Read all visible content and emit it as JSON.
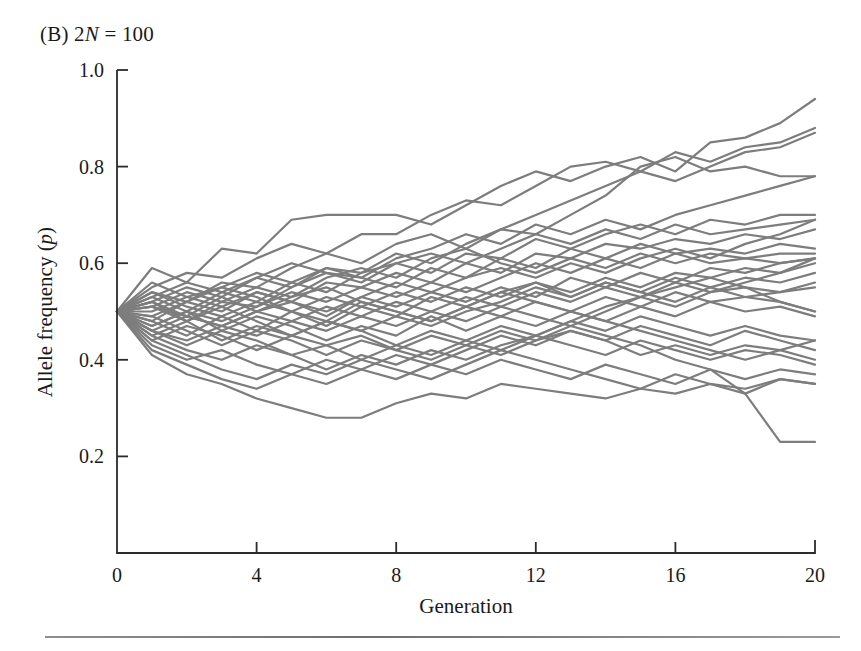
{
  "figure": {
    "panel_label": "(B)",
    "panel_title_text": "2N = 100",
    "panel_title_prefix": "2",
    "panel_title_italic": "N",
    "panel_title_suffix": " = 100",
    "background_color": "#ffffff",
    "line_color": "#7d7d7d",
    "axis_color": "#2b2b2b",
    "rule_color": "#8a8a8a"
  },
  "axes": {
    "x": {
      "title": "Generation",
      "ticks": [
        0,
        4,
        8,
        12,
        16,
        20
      ],
      "tick_labels": [
        "0",
        "4",
        "8",
        "12",
        "16",
        "20"
      ],
      "min": 0,
      "max": 20
    },
    "y": {
      "title_prefix": "Allele frequency (",
      "title_italic": "p",
      "title_suffix": ")",
      "title": "Allele frequency (p)",
      "ticks": [
        0.2,
        0.4,
        0.6,
        0.8,
        1.0
      ],
      "tick_labels": [
        "0.2",
        "0.4",
        "0.6",
        "0.8",
        "1.0"
      ],
      "min": 0.0,
      "max": 1.0
    }
  },
  "chart_data": {
    "type": "line",
    "title": "(B) 2N = 100",
    "xlabel": "Generation",
    "ylabel": "Allele frequency (p)",
    "xlim": [
      0,
      20
    ],
    "ylim": [
      0,
      1
    ],
    "grid": false,
    "legend": "none",
    "line_color": "#7d7d7d",
    "line_width": 2.2,
    "x": [
      0,
      1,
      2,
      3,
      4,
      5,
      6,
      7,
      8,
      9,
      10,
      11,
      12,
      13,
      14,
      15,
      16,
      17,
      18,
      19,
      20
    ],
    "series": [
      {
        "name": "replicate-1",
        "values": [
          0.5,
          0.59,
          0.56,
          0.63,
          0.62,
          0.69,
          0.7,
          0.7,
          0.7,
          0.68,
          0.72,
          0.76,
          0.79,
          0.77,
          0.8,
          0.82,
          0.79,
          0.85,
          0.86,
          0.89,
          0.94
        ]
      },
      {
        "name": "replicate-2",
        "values": [
          0.5,
          0.55,
          0.58,
          0.57,
          0.61,
          0.64,
          0.62,
          0.66,
          0.66,
          0.7,
          0.73,
          0.72,
          0.76,
          0.8,
          0.81,
          0.79,
          0.83,
          0.81,
          0.84,
          0.85,
          0.88
        ]
      },
      {
        "name": "replicate-3",
        "values": [
          0.5,
          0.54,
          0.52,
          0.56,
          0.55,
          0.59,
          0.62,
          0.6,
          0.64,
          0.66,
          0.63,
          0.67,
          0.7,
          0.73,
          0.76,
          0.79,
          0.77,
          0.8,
          0.83,
          0.84,
          0.87
        ]
      },
      {
        "name": "replicate-4",
        "values": [
          0.5,
          0.53,
          0.5,
          0.54,
          0.57,
          0.55,
          0.59,
          0.58,
          0.62,
          0.6,
          0.64,
          0.67,
          0.66,
          0.7,
          0.74,
          0.8,
          0.82,
          0.79,
          0.8,
          0.78,
          0.78
        ]
      },
      {
        "name": "replicate-5",
        "values": [
          0.5,
          0.52,
          0.55,
          0.53,
          0.57,
          0.6,
          0.58,
          0.57,
          0.61,
          0.63,
          0.66,
          0.64,
          0.68,
          0.66,
          0.69,
          0.67,
          0.7,
          0.72,
          0.74,
          0.76,
          0.78
        ]
      },
      {
        "name": "replicate-6",
        "values": [
          0.5,
          0.51,
          0.48,
          0.52,
          0.51,
          0.55,
          0.58,
          0.56,
          0.6,
          0.58,
          0.62,
          0.61,
          0.65,
          0.63,
          0.66,
          0.68,
          0.66,
          0.69,
          0.68,
          0.7,
          0.7
        ]
      },
      {
        "name": "replicate-7",
        "values": [
          0.5,
          0.56,
          0.53,
          0.55,
          0.58,
          0.56,
          0.54,
          0.58,
          0.6,
          0.62,
          0.6,
          0.63,
          0.66,
          0.64,
          0.67,
          0.65,
          0.68,
          0.66,
          0.67,
          0.68,
          0.69
        ]
      },
      {
        "name": "replicate-8",
        "values": [
          0.5,
          0.48,
          0.52,
          0.5,
          0.54,
          0.52,
          0.56,
          0.55,
          0.58,
          0.56,
          0.6,
          0.58,
          0.62,
          0.61,
          0.64,
          0.63,
          0.65,
          0.64,
          0.66,
          0.65,
          0.67
        ]
      },
      {
        "name": "replicate-9",
        "values": [
          0.5,
          0.53,
          0.56,
          0.54,
          0.52,
          0.56,
          0.59,
          0.57,
          0.55,
          0.59,
          0.57,
          0.61,
          0.59,
          0.63,
          0.61,
          0.64,
          0.62,
          0.63,
          0.62,
          0.64,
          0.63
        ]
      },
      {
        "name": "replicate-10",
        "values": [
          0.5,
          0.51,
          0.54,
          0.52,
          0.55,
          0.53,
          0.57,
          0.59,
          0.57,
          0.61,
          0.63,
          0.6,
          0.58,
          0.61,
          0.59,
          0.62,
          0.6,
          0.62,
          0.61,
          0.62,
          0.62
        ]
      },
      {
        "name": "replicate-11",
        "values": [
          0.5,
          0.47,
          0.5,
          0.48,
          0.51,
          0.54,
          0.52,
          0.55,
          0.53,
          0.56,
          0.54,
          0.57,
          0.6,
          0.58,
          0.61,
          0.59,
          0.62,
          0.6,
          0.61,
          0.6,
          0.61
        ]
      },
      {
        "name": "replicate-12",
        "values": [
          0.5,
          0.52,
          0.49,
          0.53,
          0.5,
          0.52,
          0.49,
          0.53,
          0.51,
          0.54,
          0.52,
          0.55,
          0.53,
          0.57,
          0.55,
          0.58,
          0.56,
          0.59,
          0.58,
          0.6,
          0.61
        ]
      },
      {
        "name": "replicate-13",
        "values": [
          0.5,
          0.49,
          0.52,
          0.55,
          0.53,
          0.5,
          0.53,
          0.51,
          0.54,
          0.52,
          0.55,
          0.53,
          0.56,
          0.54,
          0.57,
          0.55,
          0.58,
          0.57,
          0.59,
          0.58,
          0.6
        ]
      },
      {
        "name": "replicate-14",
        "values": [
          0.5,
          0.54,
          0.51,
          0.49,
          0.52,
          0.5,
          0.47,
          0.51,
          0.49,
          0.53,
          0.51,
          0.54,
          0.56,
          0.53,
          0.56,
          0.54,
          0.57,
          0.55,
          0.57,
          0.56,
          0.58
        ]
      },
      {
        "name": "replicate-15",
        "values": [
          0.5,
          0.46,
          0.49,
          0.47,
          0.5,
          0.48,
          0.51,
          0.49,
          0.52,
          0.5,
          0.53,
          0.51,
          0.54,
          0.52,
          0.55,
          0.53,
          0.56,
          0.54,
          0.55,
          0.54,
          0.56
        ]
      },
      {
        "name": "replicate-16",
        "values": [
          0.5,
          0.48,
          0.45,
          0.49,
          0.46,
          0.5,
          0.48,
          0.52,
          0.5,
          0.48,
          0.51,
          0.49,
          0.52,
          0.5,
          0.53,
          0.51,
          0.54,
          0.52,
          0.53,
          0.54,
          0.55
        ]
      },
      {
        "name": "replicate-17",
        "values": [
          0.5,
          0.52,
          0.48,
          0.51,
          0.48,
          0.45,
          0.48,
          0.46,
          0.49,
          0.47,
          0.5,
          0.52,
          0.55,
          0.53,
          0.56,
          0.54,
          0.52,
          0.55,
          0.53,
          0.52,
          0.5
        ]
      },
      {
        "name": "replicate-18",
        "values": [
          0.5,
          0.47,
          0.5,
          0.46,
          0.49,
          0.47,
          0.44,
          0.47,
          0.45,
          0.49,
          0.46,
          0.49,
          0.47,
          0.5,
          0.48,
          0.51,
          0.49,
          0.52,
          0.5,
          0.51,
          0.49
        ]
      },
      {
        "name": "replicate-19",
        "values": [
          0.5,
          0.45,
          0.48,
          0.44,
          0.47,
          0.45,
          0.48,
          0.46,
          0.43,
          0.46,
          0.44,
          0.47,
          0.45,
          0.48,
          0.46,
          0.49,
          0.47,
          0.45,
          0.47,
          0.45,
          0.44
        ]
      },
      {
        "name": "replicate-20",
        "values": [
          0.5,
          0.49,
          0.46,
          0.43,
          0.46,
          0.44,
          0.41,
          0.44,
          0.42,
          0.45,
          0.43,
          0.46,
          0.44,
          0.47,
          0.5,
          0.53,
          0.51,
          0.54,
          0.56,
          0.58,
          0.61
        ]
      },
      {
        "name": "replicate-21",
        "values": [
          0.5,
          0.44,
          0.47,
          0.45,
          0.42,
          0.45,
          0.43,
          0.4,
          0.43,
          0.41,
          0.44,
          0.42,
          0.45,
          0.43,
          0.41,
          0.44,
          0.42,
          0.4,
          0.42,
          0.41,
          0.39
        ]
      },
      {
        "name": "replicate-22",
        "values": [
          0.5,
          0.46,
          0.43,
          0.46,
          0.44,
          0.41,
          0.43,
          0.45,
          0.42,
          0.4,
          0.43,
          0.41,
          0.44,
          0.46,
          0.44,
          0.41,
          0.43,
          0.41,
          0.43,
          0.42,
          0.44
        ]
      },
      {
        "name": "replicate-23",
        "values": [
          0.5,
          0.45,
          0.42,
          0.4,
          0.43,
          0.41,
          0.38,
          0.41,
          0.39,
          0.42,
          0.4,
          0.43,
          0.45,
          0.48,
          0.51,
          0.53,
          0.55,
          0.57,
          0.55,
          0.52,
          0.5
        ]
      },
      {
        "name": "replicate-24",
        "values": [
          0.5,
          0.43,
          0.4,
          0.42,
          0.39,
          0.37,
          0.4,
          0.38,
          0.41,
          0.39,
          0.37,
          0.4,
          0.38,
          0.36,
          0.39,
          0.37,
          0.35,
          0.38,
          0.36,
          0.38,
          0.37
        ]
      },
      {
        "name": "replicate-25",
        "values": [
          0.5,
          0.44,
          0.41,
          0.38,
          0.36,
          0.39,
          0.37,
          0.4,
          0.38,
          0.36,
          0.39,
          0.42,
          0.4,
          0.38,
          0.36,
          0.34,
          0.37,
          0.35,
          0.33,
          0.36,
          0.35
        ]
      },
      {
        "name": "replicate-26",
        "values": [
          0.5,
          0.42,
          0.39,
          0.36,
          0.34,
          0.37,
          0.35,
          0.38,
          0.36,
          0.39,
          0.42,
          0.45,
          0.43,
          0.46,
          0.44,
          0.47,
          0.45,
          0.43,
          0.46,
          0.44,
          0.42
        ]
      },
      {
        "name": "replicate-27",
        "values": [
          0.5,
          0.41,
          0.37,
          0.35,
          0.32,
          0.3,
          0.28,
          0.28,
          0.31,
          0.33,
          0.32,
          0.35,
          0.34,
          0.33,
          0.32,
          0.34,
          0.33,
          0.35,
          0.34,
          0.36,
          0.35
        ]
      },
      {
        "name": "replicate-28",
        "values": [
          0.5,
          0.46,
          0.44,
          0.47,
          0.45,
          0.48,
          0.46,
          0.49,
          0.47,
          0.5,
          0.48,
          0.51,
          0.49,
          0.47,
          0.45,
          0.43,
          0.4,
          0.38,
          0.33,
          0.23,
          0.23
        ]
      },
      {
        "name": "replicate-29",
        "values": [
          0.5,
          0.5,
          0.53,
          0.51,
          0.54,
          0.52,
          0.5,
          0.53,
          0.56,
          0.54,
          0.57,
          0.59,
          0.57,
          0.6,
          0.58,
          0.61,
          0.63,
          0.61,
          0.64,
          0.66,
          0.69
        ]
      },
      {
        "name": "replicate-30",
        "values": [
          0.5,
          0.51,
          0.49,
          0.47,
          0.5,
          0.53,
          0.55,
          0.52,
          0.5,
          0.48,
          0.51,
          0.54,
          0.52,
          0.5,
          0.48,
          0.46,
          0.44,
          0.42,
          0.4,
          0.42,
          0.4
        ]
      }
    ]
  }
}
